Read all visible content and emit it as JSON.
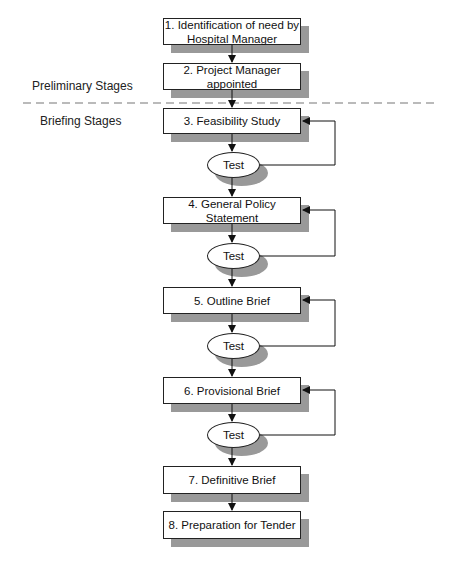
{
  "diagram": {
    "sections": {
      "preliminary": "Preliminary Stages",
      "briefing": "Briefing Stages"
    },
    "stages": [
      {
        "id": 1,
        "label": "1. Identification of need by Hospital Manager",
        "line1": "1. Identification of need by",
        "line2": "Hospital Manager"
      },
      {
        "id": 2,
        "label": "2. Project Manager appointed",
        "line1": "2. Project Manager",
        "line2": "appointed"
      },
      {
        "id": 3,
        "label": "3. Feasibility Study"
      },
      {
        "id": 4,
        "label": "4. General Policy Statement"
      },
      {
        "id": 5,
        "label": "5. Outline Brief"
      },
      {
        "id": 6,
        "label": "6. Provisional Brief"
      },
      {
        "id": 7,
        "label": "7. Definitive Brief"
      },
      {
        "id": 8,
        "label": "8. Preparation for Tender"
      }
    ],
    "tests": [
      {
        "after_stage": 3,
        "label": "Test",
        "loops_back_to": 3
      },
      {
        "after_stage": 4,
        "label": "Test",
        "loops_back_to": 4
      },
      {
        "after_stage": 5,
        "label": "Test",
        "loops_back_to": 5
      },
      {
        "after_stage": 6,
        "label": "Test",
        "loops_back_to": 6
      }
    ],
    "colors": {
      "line": "#222222",
      "shadow": "#999999",
      "box_fill": "#ffffff"
    }
  }
}
